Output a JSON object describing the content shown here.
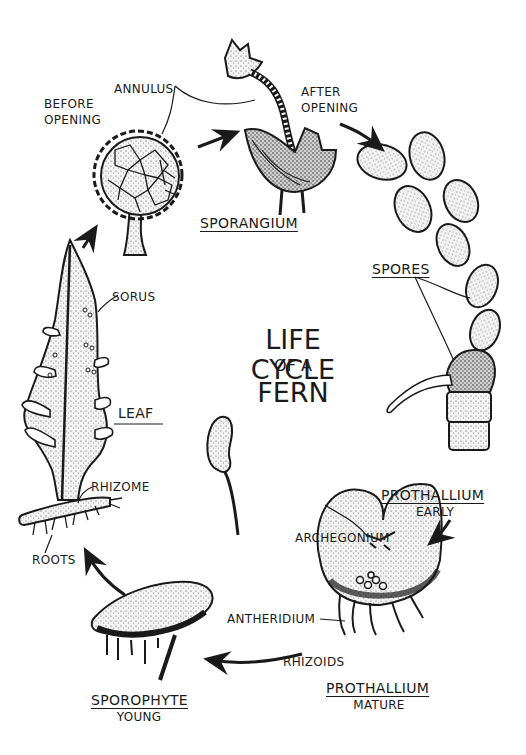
{
  "title": {
    "line1": "LIFE CYCLE",
    "line2": "OF A",
    "line3": "FERN"
  },
  "stages": {
    "sporangium": {
      "name": "SPORANGIUM",
      "before_opening": "BEFORE\nOPENING",
      "after_opening": "AFTER\nOPENING",
      "annulus": "ANNULUS"
    },
    "spores": {
      "name": "SPORES"
    },
    "prothallium_early": {
      "name": "PROTHALLIUM",
      "sub": "EARLY"
    },
    "prothallium_mature": {
      "name": "PROTHALLIUM",
      "sub": "MATURE",
      "archegonium": "ARCHEGONIUM",
      "antheridium": "ANTHERIDIUM",
      "rhizoids": "RHIZOIDS"
    },
    "sporophyte": {
      "name": "SPOROPHYTE",
      "sub": "YOUNG"
    },
    "leaf": {
      "name": "LEAF",
      "sorus": "SORUS",
      "rhizome": "RHIZOME",
      "roots": "ROOTS"
    }
  },
  "colors": {
    "ink": "#1a1a1a",
    "background": "#ffffff",
    "stipple": "#bdbdbd"
  }
}
